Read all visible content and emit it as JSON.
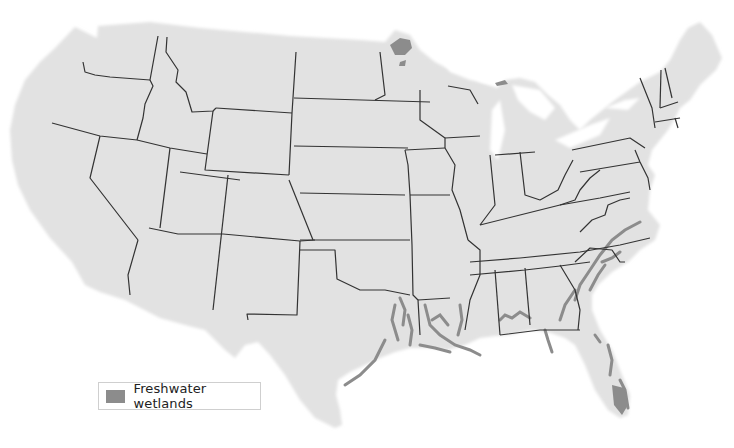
{
  "map": {
    "title": "",
    "region": "Contiguous United States",
    "land_color": "#e2e2e2",
    "border_color": "#333333",
    "wetland_color": "#8c8c8c"
  },
  "legend": {
    "items": [
      {
        "label": "Freshwater wetlands",
        "color": "#8c8c8c"
      }
    ]
  }
}
